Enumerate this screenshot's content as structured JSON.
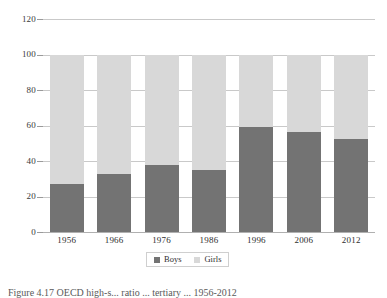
{
  "chart_data": {
    "type": "bar",
    "subtype": "stacked-bar-100-percent",
    "title": "",
    "xlabel": "",
    "ylabel": "",
    "categories": [
      "1956",
      "1966",
      "1976",
      "1986",
      "1996",
      "2006",
      "2012"
    ],
    "series": [
      {
        "name": "Boys",
        "color": "#737373",
        "values": [
          27,
          32.5,
          38,
          35,
          59,
          56.5,
          52.5
        ]
      },
      {
        "name": "Girls",
        "color": "#d8d8d8",
        "values": [
          73,
          67.5,
          62,
          65,
          41,
          43.5,
          47.5
        ]
      }
    ],
    "ylim": [
      0,
      120
    ],
    "ytick_values": [
      0,
      20,
      40,
      60,
      80,
      100,
      120
    ],
    "ytick_labels": [
      "0",
      "20",
      "40",
      "60",
      "80",
      "100",
      "120"
    ],
    "grid": true,
    "grid_axis": "y",
    "legend_position": "bottom",
    "legend_entries": [
      {
        "label": "Boys",
        "color": "#737373"
      },
      {
        "label": "Girls",
        "color": "#d8d8d8"
      }
    ]
  },
  "caption": {
    "text": "Figure 4.17  OECD high-s... ratio ... tertiary ... 1956-2012"
  },
  "colors": {
    "boys": "#737373",
    "girls": "#d8d8d8",
    "gridline": "#c9c9c9",
    "text": "#2e2e2e",
    "background": "#ffffff"
  }
}
